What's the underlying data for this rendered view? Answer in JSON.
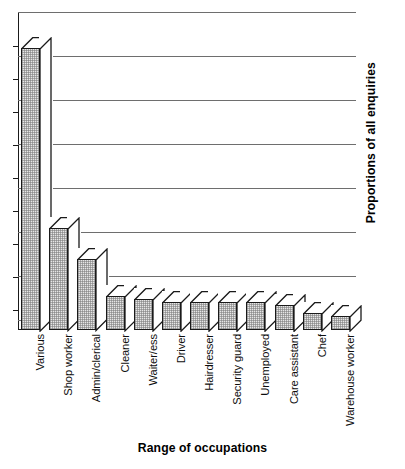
{
  "chart_data": {
    "type": "bar",
    "title": "",
    "xlabel": "Range of occupations",
    "ylabel": "Proportions of all enquiries",
    "categories": [
      "Various",
      "Shop worker",
      "Admin/clerical",
      "Cleaner",
      "Waiter/ess",
      "Driver",
      "Hairdresser",
      "Security guard",
      "Unemployed",
      "Care assistant",
      "Chef",
      "Warehouse worker"
    ],
    "values": [
      100,
      36,
      25,
      12,
      11,
      10,
      10,
      10,
      10,
      9,
      6,
      5
    ],
    "ylim": [
      0,
      107
    ],
    "grid": true,
    "gridlines": 8,
    "axis_tick_labels": [],
    "legend": "none",
    "style": "3d-isometric-bars"
  },
  "axis": {
    "x_title": "Range of occupations",
    "y_title": "Proportions of all enquiries"
  },
  "colors": {
    "bar_face": "#e6e6e6",
    "bar_outline": "#1a1a1a",
    "bar_top": "#ffffff",
    "gridline": "#6e6e6e",
    "axis": "#1a1a1a",
    "background": "#ffffff",
    "text": "#0d0d0d"
  }
}
